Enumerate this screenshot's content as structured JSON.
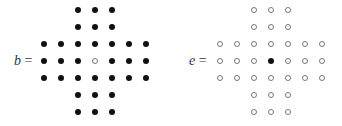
{
  "boards": [
    {
      "name": "b",
      "label_var": "b",
      "label_eq": "=",
      "filled_color": "#111111",
      "layout": [
        "  XXX  ",
        "  XXX  ",
        "XXXXXXX",
        "XXXOXXX",
        "XXXXXXX",
        "  XXX  ",
        "  XXX  "
      ]
    },
    {
      "name": "e",
      "label_var": "e",
      "label_eq": "=",
      "filled_color": "#111111",
      "layout": [
        "  OOO  ",
        "  OOO  ",
        "OOOOOOO",
        "OOOXOOO",
        "OOOOOOO",
        "  OOO  ",
        "  OOO  "
      ]
    }
  ]
}
